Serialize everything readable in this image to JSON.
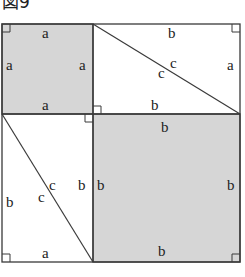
{
  "title": "図9",
  "colors": {
    "shade": "#d6d6d6",
    "line": "#3a3a3a",
    "background": "#ffffff"
  },
  "regions": {
    "square_a": {
      "side_label": "a",
      "labels": {
        "top": "a",
        "left": "a",
        "right": "a",
        "bottom": "a"
      }
    },
    "triangle_top_right": {
      "labels": {
        "top": "b",
        "right": "a",
        "hyp_upper": "c",
        "hyp_lower": "c",
        "bottom": "b"
      }
    },
    "triangle_bottom_left": {
      "labels": {
        "left": "b",
        "hyp_upper": "c",
        "hyp_lower": "c",
        "right": "b",
        "bottom": "a"
      }
    },
    "square_b": {
      "side_label": "b",
      "labels": {
        "top": "b",
        "left": "b",
        "right": "b",
        "bottom": "b"
      }
    }
  }
}
